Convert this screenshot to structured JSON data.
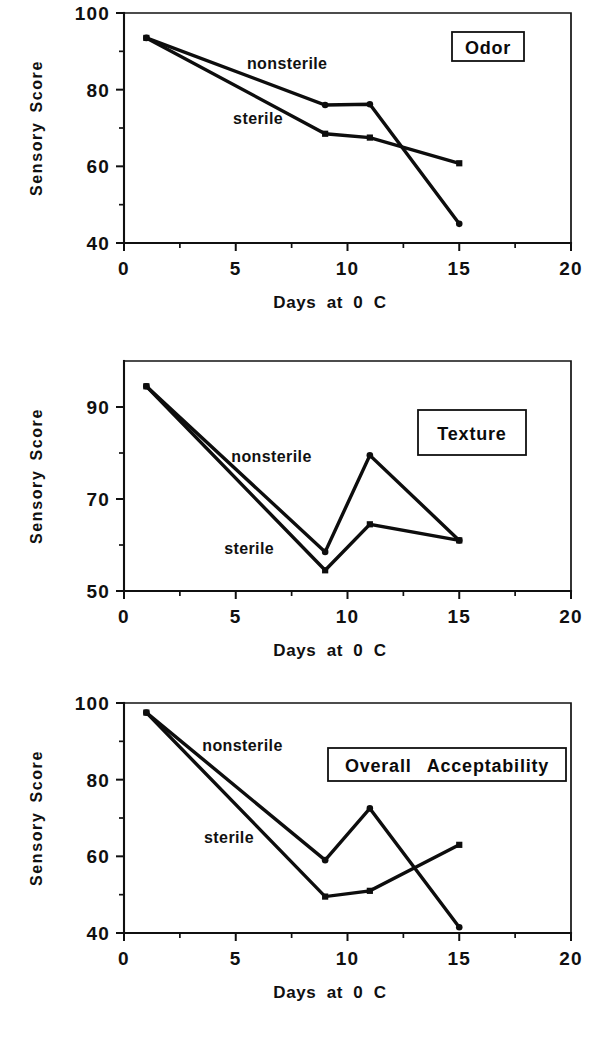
{
  "figure": {
    "background": "#ffffff",
    "ink_color": "#101010"
  },
  "common": {
    "y_axis_title": "Sensory Score",
    "x_axis_title": "Days at 0 C",
    "series_labels": {
      "nonsterile": "nonsterile",
      "sterile": "sterile"
    }
  },
  "chart_data": [
    {
      "type": "line",
      "title": "Odor",
      "xlabel": "Days at 0 C",
      "ylabel": "Sensory Score",
      "xlim": [
        0,
        20
      ],
      "ylim": [
        40,
        100
      ],
      "xticks": [
        0,
        5,
        10,
        15,
        20
      ],
      "xtick_labels": [
        "0",
        "5",
        "10",
        "15",
        "20"
      ],
      "yticks": [
        40,
        60,
        80,
        100
      ],
      "ytick_labels": [
        "40",
        "60",
        "80",
        "100"
      ],
      "yminor": [
        50,
        70,
        90
      ],
      "xminor": [
        2.5,
        7.5,
        12.5,
        17.5
      ],
      "grid": false,
      "legend_position": "inline-annotations",
      "x": [
        1,
        9,
        11,
        15
      ],
      "series": [
        {
          "name": "nonsterile",
          "marker": "circle",
          "values": [
            93.5,
            76.0,
            76.2,
            45.0
          ]
        },
        {
          "name": "sterile",
          "marker": "square",
          "values": [
            93.5,
            68.5,
            67.5,
            60.8
          ]
        }
      ],
      "annotations": [
        {
          "text": "nonsterile",
          "x": 7.3,
          "y": 85.5
        },
        {
          "text": "sterile",
          "x": 6.0,
          "y": 71.0
        }
      ]
    },
    {
      "type": "line",
      "title": "Texture",
      "xlabel": "Days at 0 C",
      "ylabel": "Sensory Score",
      "xlim": [
        0,
        20
      ],
      "ylim": [
        50,
        100
      ],
      "xticks": [
        0,
        5,
        10,
        15,
        20
      ],
      "xtick_labels": [
        "0",
        "5",
        "10",
        "15",
        "20"
      ],
      "yticks": [
        50,
        70,
        90
      ],
      "ytick_labels": [
        "50",
        "70",
        "90"
      ],
      "yminor": [
        60,
        80,
        100
      ],
      "xminor": [
        2.5,
        7.5,
        12.5,
        17.5
      ],
      "grid": false,
      "legend_position": "inline-annotations",
      "x": [
        1,
        9,
        11,
        15
      ],
      "series": [
        {
          "name": "nonsterile",
          "marker": "circle",
          "values": [
            94.5,
            58.5,
            79.5,
            61.0
          ]
        },
        {
          "name": "sterile",
          "marker": "square",
          "values": [
            94.5,
            54.5,
            64.5,
            61.0
          ]
        }
      ],
      "annotations": [
        {
          "text": "nonsterile",
          "x": 6.6,
          "y": 78.0
        },
        {
          "text": "sterile",
          "x": 5.6,
          "y": 58.0
        }
      ]
    },
    {
      "type": "line",
      "title": "Overall  Acceptability",
      "xlabel": "Days at 0 C",
      "ylabel": "Sensory Score",
      "xlim": [
        0,
        20
      ],
      "ylim": [
        40,
        100
      ],
      "xticks": [
        0,
        5,
        10,
        15,
        20
      ],
      "xtick_labels": [
        "0",
        "5",
        "10",
        "15",
        "20"
      ],
      "yticks": [
        40,
        60,
        80,
        100
      ],
      "ytick_labels": [
        "40",
        "60",
        "80",
        "100"
      ],
      "yminor": [
        50,
        70,
        90
      ],
      "xminor": [
        2.5,
        7.5,
        12.5,
        17.5
      ],
      "grid": false,
      "legend_position": "inline-annotations",
      "x": [
        1,
        9,
        11,
        15
      ],
      "series": [
        {
          "name": "nonsterile",
          "marker": "circle",
          "values": [
            97.5,
            59.0,
            72.5,
            41.5
          ]
        },
        {
          "name": "sterile",
          "marker": "square",
          "values": [
            97.5,
            49.5,
            51.0,
            63.0
          ]
        }
      ],
      "annotations": [
        {
          "text": "nonsterile",
          "x": 5.3,
          "y": 87.5
        },
        {
          "text": "sterile",
          "x": 4.7,
          "y": 63.5
        }
      ]
    }
  ]
}
